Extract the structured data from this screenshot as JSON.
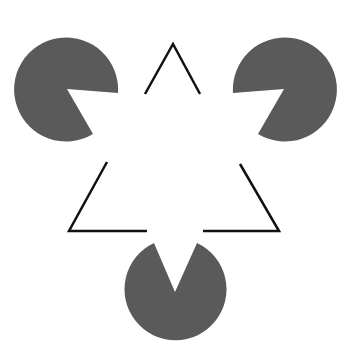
{
  "colors": {
    "background": "#ffffff",
    "pacman_fill": "#5a5a5a",
    "line_stroke": "#111111"
  },
  "pacmen": [
    {
      "name": "top-left",
      "cx": 67,
      "cy": 89,
      "r": 52
    },
    {
      "name": "top-right",
      "cx": 284,
      "cy": 89,
      "r": 52
    },
    {
      "name": "bottom",
      "cx": 175,
      "cy": 292,
      "r": 51
    }
  ],
  "outline_triangle": {
    "apex": [
      173,
      44
    ],
    "bottom_left": [
      69,
      231
    ],
    "bottom_right": [
      279,
      231
    ],
    "stroke_width": 2.5
  }
}
